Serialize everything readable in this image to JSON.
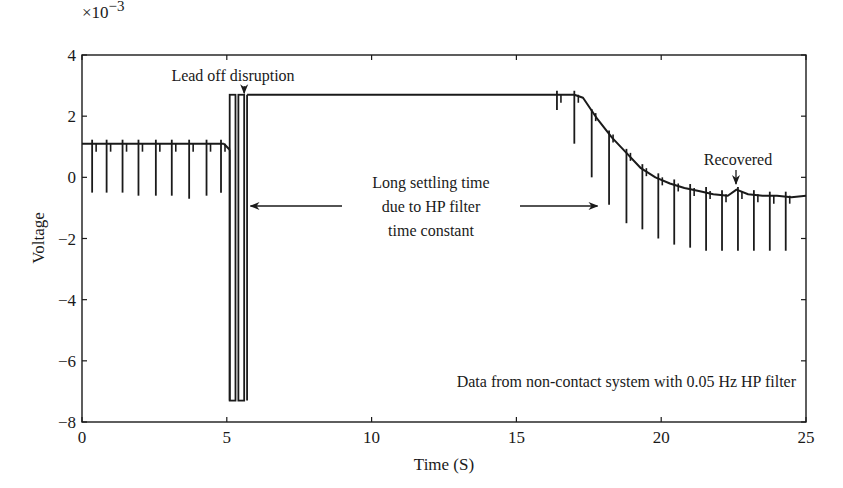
{
  "chart_data": {
    "type": "line",
    "title": "",
    "xlabel": "Time (S)",
    "ylabel": "Voltage",
    "y_multiplier": "×10−3",
    "xlim": [
      0,
      25
    ],
    "ylim": [
      -8,
      4
    ],
    "xticks": [
      0,
      5,
      10,
      15,
      20,
      25
    ],
    "yticks": [
      -8,
      -6,
      -4,
      -2,
      0,
      2,
      4
    ],
    "grid": false,
    "legend": null,
    "series": [
      {
        "name": "Voltage",
        "color": "#1a1a1a",
        "description": "ECG-like signal ~1.1e-3 baseline with periodic negative spikes (to ~-0.6e-3) every ~0.58 s for t<5; lead-off disruption pulses to 2.7e-3 and -7.3e-3 at t≈5.1–5.7; flat saturated level 2.7e-3 from t≈5.7 to 17; exponential decay to ~-0.6e-3 by t=25 with spikes continuing",
        "baseline_segments": [
          {
            "x": [
              0,
              4.9
            ],
            "y": [
              1.1,
              1.1
            ]
          },
          {
            "x": [
              4.9,
              5.1
            ],
            "y": [
              1.1,
              0.9
            ]
          },
          {
            "x": [
              5.7,
              17.0
            ],
            "y": [
              2.7,
              2.7
            ]
          },
          {
            "x": [
              17.0,
              17.3,
              17.8,
              18.3,
              18.8,
              19.3,
              19.8,
              20.3,
              20.8,
              21.3,
              21.8,
              22.3,
              22.6,
              23.0,
              23.5,
              24.0,
              24.5,
              25.0
            ],
            "y": [
              2.7,
              2.6,
              1.9,
              1.3,
              0.8,
              0.3,
              0.0,
              -0.2,
              -0.35,
              -0.45,
              -0.55,
              -0.6,
              -0.4,
              -0.55,
              -0.6,
              -0.6,
              -0.65,
              -0.6
            ]
          }
        ],
        "pulses": [
          {
            "x0": 5.1,
            "x1": 5.3,
            "top": 2.7,
            "bottom": -7.3
          },
          {
            "x0": 5.4,
            "x1": 5.6,
            "top": 2.7,
            "bottom": -7.3
          }
        ],
        "spikes": [
          {
            "x": 0.35,
            "y_base": 1.1,
            "y_tip": -0.5
          },
          {
            "x": 0.85,
            "y_base": 1.1,
            "y_tip": -0.5
          },
          {
            "x": 1.4,
            "y_base": 1.1,
            "y_tip": -0.5
          },
          {
            "x": 1.95,
            "y_base": 1.1,
            "y_tip": -0.6
          },
          {
            "x": 2.55,
            "y_base": 1.1,
            "y_tip": -0.6
          },
          {
            "x": 3.1,
            "y_base": 1.1,
            "y_tip": -0.6
          },
          {
            "x": 3.7,
            "y_base": 1.1,
            "y_tip": -0.7
          },
          {
            "x": 4.3,
            "y_base": 1.1,
            "y_tip": -0.6
          },
          {
            "x": 4.8,
            "y_base": 1.1,
            "y_tip": -0.5
          },
          {
            "x": 16.4,
            "y_base": 2.7,
            "y_tip": 2.2
          },
          {
            "x": 17.0,
            "y_base": 2.7,
            "y_tip": 1.1
          },
          {
            "x": 17.6,
            "y_base": 2.1,
            "y_tip": 0.0
          },
          {
            "x": 18.2,
            "y_base": 1.4,
            "y_tip": -0.9
          },
          {
            "x": 18.8,
            "y_base": 0.8,
            "y_tip": -1.5
          },
          {
            "x": 19.35,
            "y_base": 0.3,
            "y_tip": -1.7
          },
          {
            "x": 19.9,
            "y_base": 0.0,
            "y_tip": -2.0
          },
          {
            "x": 20.45,
            "y_base": -0.2,
            "y_tip": -2.2
          },
          {
            "x": 21.0,
            "y_base": -0.35,
            "y_tip": -2.3
          },
          {
            "x": 21.55,
            "y_base": -0.45,
            "y_tip": -2.4
          },
          {
            "x": 22.1,
            "y_base": -0.55,
            "y_tip": -2.4
          },
          {
            "x": 22.65,
            "y_base": -0.45,
            "y_tip": -2.4
          },
          {
            "x": 23.2,
            "y_base": -0.55,
            "y_tip": -2.4
          },
          {
            "x": 23.75,
            "y_base": -0.6,
            "y_tip": -2.4
          },
          {
            "x": 24.3,
            "y_base": -0.6,
            "y_tip": -2.4
          }
        ]
      }
    ],
    "annotations": [
      {
        "text": "Lead off disruption",
        "x": 5.7,
        "y": 3.4,
        "arrow_to": [
          5.6,
          2.75
        ]
      },
      {
        "lines": [
          "Long settling time",
          "due to HP filter",
          "time constant"
        ],
        "x": 11.5,
        "y": -1.0,
        "arrow_left_to": 5.7,
        "arrow_right_to": 17.8
      },
      {
        "text": "Recovered",
        "x": 22.6,
        "y": 0.1,
        "arrow_to": [
          22.6,
          -0.3
        ]
      },
      {
        "text": "Data from non-contact system with 0.05 Hz HP filter",
        "x": 16.5,
        "y": -6.9
      }
    ]
  },
  "labels": {
    "multiplier": "×10",
    "multiplier_exp": "−3",
    "xlabel": "Time (S)",
    "ylabel": "Voltage",
    "ann_lead_off": "Lead off disruption",
    "ann_settling_1": "Long settling time",
    "ann_settling_2": "due to HP filter",
    "ann_settling_3": "time constant",
    "ann_recovered": "Recovered",
    "ann_data": "Data from non-contact system with 0.05 Hz HP filter"
  }
}
